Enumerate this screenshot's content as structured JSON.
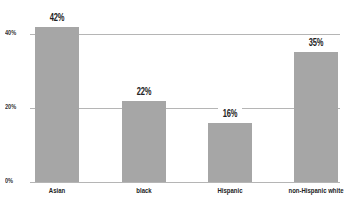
{
  "chart_data": {
    "type": "bar",
    "title": "",
    "xlabel": "",
    "ylabel": "",
    "categories": [
      "Asian",
      "black",
      "Hispanic",
      "non-Hispanic white"
    ],
    "values": [
      42,
      22,
      16,
      35
    ],
    "value_labels": [
      "42%",
      "22%",
      "16%",
      "35%"
    ],
    "ylim": [
      0,
      45
    ],
    "yticks": [
      0,
      20,
      40
    ],
    "ytick_labels": [
      "0%",
      "20%",
      "40%"
    ],
    "grid": true,
    "legend": null,
    "bar_color": "#a6a6a6",
    "grid_color": "#b5b5b5"
  }
}
